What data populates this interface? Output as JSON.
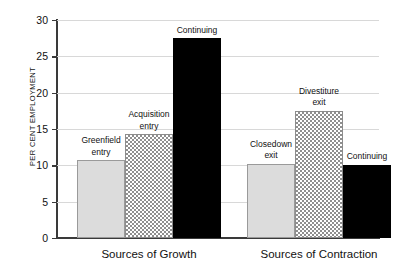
{
  "chart_data": {
    "type": "bar",
    "title": "",
    "xlabel": "",
    "ylabel": "PER CENT EMPLOYMENT",
    "ylim": [
      0,
      30
    ],
    "yticks": [
      "0",
      "5",
      "10",
      "15",
      "20",
      "25",
      "30"
    ],
    "grid": true,
    "legend": "none",
    "groups": [
      {
        "name": "Sources of Growth",
        "categories": [
          "Greenfield entry",
          "Acquisition entry",
          "Continuing"
        ],
        "values": [
          10.7,
          14.3,
          27.5
        ]
      },
      {
        "name": "Sources of Contraction",
        "categories": [
          "Closedown exit",
          "Divestiture exit",
          "Continuing"
        ],
        "values": [
          10.2,
          17.5,
          10.1
        ]
      }
    ],
    "bars": [
      {
        "label_line1": "Greenfield",
        "label_line2": "entry",
        "value": 10.7,
        "style": "light",
        "group": "Sources of Growth"
      },
      {
        "label_line1": "Acquisition",
        "label_line2": "entry",
        "value": 14.3,
        "style": "hatch",
        "group": "Sources of Growth"
      },
      {
        "label_line1": "Continuing",
        "label_line2": "",
        "value": 27.5,
        "style": "dark",
        "group": "Sources of Growth"
      },
      {
        "label_line1": "Closedown",
        "label_line2": "exit",
        "value": 10.2,
        "style": "light",
        "group": "Sources of Contraction"
      },
      {
        "label_line1": "Divestiture",
        "label_line2": "exit",
        "value": 17.5,
        "style": "hatch",
        "group": "Sources of Contraction"
      },
      {
        "label_line1": "Continuing",
        "label_line2": "",
        "value": 10.1,
        "style": "dark",
        "group": "Sources of Contraction"
      }
    ],
    "colors": {
      "light": "#dcdcdc",
      "hatch": "#8f8f8f",
      "dark": "#000000",
      "axis": "#3a3a3a",
      "grid": "#d8d8d8",
      "text": "#111111",
      "background": "#ffffff"
    }
  }
}
